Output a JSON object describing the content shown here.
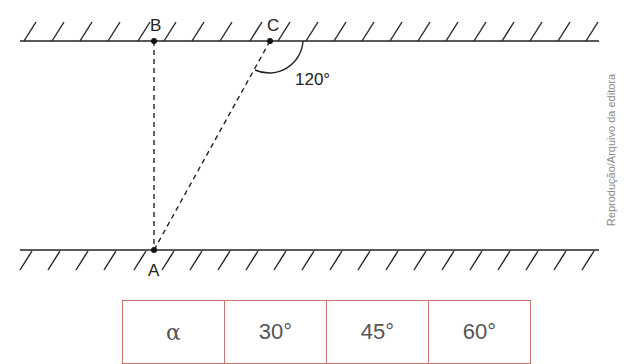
{
  "diagram": {
    "points": {
      "A": {
        "label": "A"
      },
      "B": {
        "label": "B"
      },
      "C": {
        "label": "C"
      }
    },
    "angle_label": "120°",
    "credit": "Reprodução/Arquivo da editora"
  },
  "table": {
    "cells": [
      "α",
      "30°",
      "45°",
      "60°"
    ]
  },
  "colors": {
    "line": "#222222",
    "table_border": "#c9736b",
    "table_text": "#555555",
    "credit": "#8a8a8a"
  }
}
